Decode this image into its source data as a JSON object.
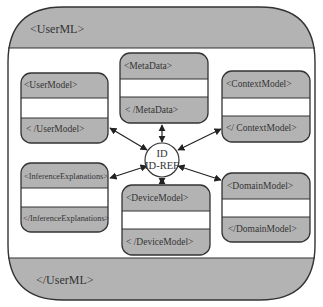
{
  "diagram": {
    "outer": {
      "open_tag": "<UserML>",
      "close_tag": "</UserML>"
    },
    "hub": {
      "line1": "ID",
      "line2": "ID-REF"
    },
    "boxes": [
      {
        "name": "user-model",
        "open_tag": "<UserModel>",
        "close_tag": "< /UserModel>"
      },
      {
        "name": "meta-data",
        "open_tag": "<MetaData>",
        "close_tag": "< /MetaData>"
      },
      {
        "name": "context-model",
        "open_tag": "<ContextModel>",
        "close_tag": "</ ContextModel>"
      },
      {
        "name": "inference-explanations",
        "open_tag": "<InferenceExplanations>",
        "close_tag": "</InferenceExplanations>"
      },
      {
        "name": "device-model",
        "open_tag": "<DeviceModel>",
        "close_tag": "< /DeviceModel>"
      },
      {
        "name": "domain-model",
        "open_tag": "<DomainModel>",
        "close_tag": "</DomainModel>"
      }
    ],
    "colors": {
      "band_fill": "#b3b3b3",
      "stroke": "#333333",
      "background": "#ffffff"
    }
  }
}
